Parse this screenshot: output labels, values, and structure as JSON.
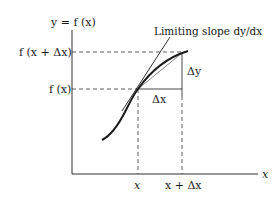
{
  "diagram": {
    "y_axis_label": "y = f (x)",
    "x_axis_label": "x",
    "y_ticks": {
      "upper": "f (x + Δx)",
      "lower": "f (x)"
    },
    "x_ticks": {
      "left": "x",
      "right": "x + Δx"
    },
    "annotations": {
      "tangent": "Limiting slope dy/dx",
      "delta_x": "Δx",
      "delta_y": "Δy"
    },
    "colors": {
      "ink": "#1a1a1a",
      "secant": "#555555",
      "background": "#ffffff"
    }
  }
}
